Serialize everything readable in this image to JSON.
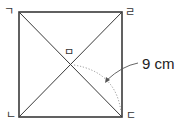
{
  "figure": {
    "type": "square-with-diagonals",
    "vertices": {
      "top_left": "ㄱ",
      "bottom_left": "ㄴ",
      "bottom_right": "ㄷ",
      "top_right": "ㄹ"
    },
    "center_label": "ㅁ",
    "measurement": {
      "label": "9 cm",
      "segment": "ㅁㄷ"
    },
    "colors": {
      "stroke": "#3a3a3a",
      "dotted": "#888888",
      "text": "#222222"
    }
  }
}
